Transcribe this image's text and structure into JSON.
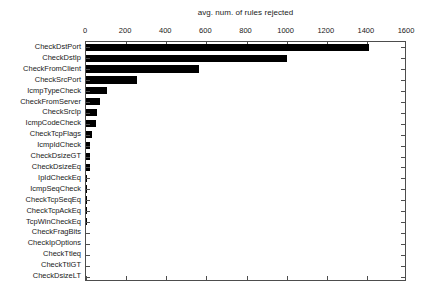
{
  "chart_data": {
    "type": "bar",
    "orientation": "horizontal",
    "title": "avg. num. of rules rejected",
    "xlabel": "",
    "ylabel": "",
    "xlim": [
      0,
      1600
    ],
    "xticks": [
      0,
      200,
      400,
      600,
      800,
      1000,
      1200,
      1400,
      1600
    ],
    "xtick_labels": [
      "0",
      "200",
      "400",
      "600",
      "800",
      "1000",
      "1200",
      "1400",
      "1600"
    ],
    "grid": false,
    "legend": null,
    "bar_color": "#000000",
    "frame_color": "#4d4d4d",
    "categories": [
      "CheckDstPort",
      "CheckDstIp",
      "CheckFromClient",
      "CheckSrcPort",
      "IcmpTypeCheck",
      "CheckFromServer",
      "CheckSrcIp",
      "IcmpCodeCheck",
      "CheckTcpFlags",
      "IcmpIdCheck",
      "CheckDsizeGT",
      "CheckDsizeEq",
      "IpIdCheckEq",
      "IcmpSeqCheck",
      "CheckTcpSeqEq",
      "CheckTcpAckEq",
      "TcpWinCheckEq",
      "CheckFragBits",
      "CheckIpOptions",
      "CheckTtleq",
      "CheckTtlGT",
      "CheckDsizeLT"
    ],
    "values": [
      1410,
      1000,
      563,
      254,
      105,
      70,
      53,
      48,
      28,
      22,
      20,
      18,
      6,
      4,
      3,
      2,
      2,
      1,
      1,
      1,
      1,
      1
    ]
  }
}
